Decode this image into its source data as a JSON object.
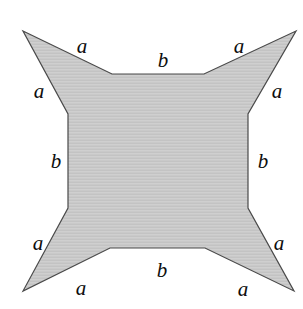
{
  "figure": {
    "name": "four-pointed-star-polygon",
    "background_color": "#ffffff",
    "fill_color": "#c9c9c9",
    "stroke_color": "#4a4a4a",
    "stroke_width": 1.2,
    "width": 303,
    "height": 309,
    "shape": {
      "type": "concave-polygon",
      "point_count": 4,
      "tips": [
        {
          "name": "top-left-tip",
          "x": 23,
          "y": 31
        },
        {
          "name": "top-right-tip",
          "x": 296,
          "y": 31
        },
        {
          "name": "bottom-right-tip",
          "x": 294,
          "y": 291
        },
        {
          "name": "bottom-left-tip",
          "x": 23,
          "y": 291
        }
      ],
      "inner_vertices": [
        {
          "name": "top-left-inner",
          "x": 112,
          "y": 74
        },
        {
          "name": "top-right-inner",
          "x": 204,
          "y": 74
        },
        {
          "name": "right-top-inner",
          "x": 248,
          "y": 114
        },
        {
          "name": "right-bottom-inner",
          "x": 248,
          "y": 208
        },
        {
          "name": "bottom-right-inner",
          "x": 205,
          "y": 248
        },
        {
          "name": "bottom-left-inner",
          "x": 110,
          "y": 248
        },
        {
          "name": "left-bottom-inner",
          "x": 68,
          "y": 208
        },
        {
          "name": "left-top-inner",
          "x": 68,
          "y": 114
        }
      ],
      "outline_path": "M 23 31 L 112 74 L 204 74 L 296 31 L 248 114 L 248 208 L 294 291 L 205 248 L 110 248 L 23 291 L 68 208 L 68 114 Z"
    },
    "labels": [
      {
        "name": "label-a-top-left",
        "text": "a",
        "x": 82,
        "y": 46
      },
      {
        "name": "label-a-top-right",
        "text": "a",
        "x": 239,
        "y": 46
      },
      {
        "name": "label-b-top",
        "text": "b",
        "x": 163,
        "y": 60
      },
      {
        "name": "label-a-left-upper",
        "text": "a",
        "x": 39,
        "y": 91
      },
      {
        "name": "label-a-right-upper",
        "text": "a",
        "x": 277,
        "y": 91
      },
      {
        "name": "label-b-left",
        "text": "b",
        "x": 56,
        "y": 161
      },
      {
        "name": "label-b-right",
        "text": "b",
        "x": 263,
        "y": 161
      },
      {
        "name": "label-a-left-lower",
        "text": "a",
        "x": 38,
        "y": 243
      },
      {
        "name": "label-a-right-lower",
        "text": "a",
        "x": 279,
        "y": 243
      },
      {
        "name": "label-b-bottom",
        "text": "b",
        "x": 162,
        "y": 270
      },
      {
        "name": "label-a-bottom-left",
        "text": "a",
        "x": 81,
        "y": 288
      },
      {
        "name": "label-a-bottom-right",
        "text": "a",
        "x": 243,
        "y": 289
      }
    ]
  }
}
